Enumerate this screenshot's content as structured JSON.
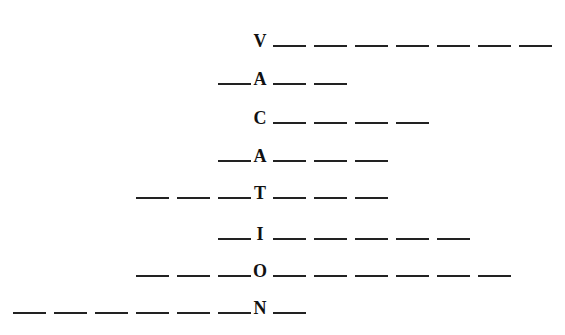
{
  "puzzle": {
    "word": "VACATION",
    "rows": [
      {
        "letter": "V",
        "left_blanks": 0,
        "right_blanks": 7,
        "top": 27
      },
      {
        "letter": "A",
        "left_blanks": 1,
        "right_blanks": 2,
        "top": 65
      },
      {
        "letter": "C",
        "left_blanks": 0,
        "right_blanks": 4,
        "top": 104
      },
      {
        "letter": "A",
        "left_blanks": 1,
        "right_blanks": 3,
        "top": 142
      },
      {
        "letter": "T",
        "left_blanks": 3,
        "right_blanks": 3,
        "top": 179
      },
      {
        "letter": "I",
        "left_blanks": 1,
        "right_blanks": 5,
        "top": 220
      },
      {
        "letter": "O",
        "left_blanks": 3,
        "right_blanks": 6,
        "top": 257
      },
      {
        "letter": "N",
        "left_blanks": 6,
        "right_blanks": 1,
        "top": 294
      }
    ]
  }
}
